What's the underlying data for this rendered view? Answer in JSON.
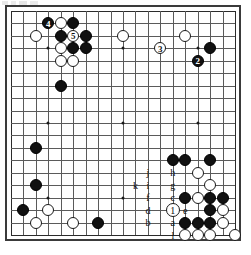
{
  "diagram": {
    "kind": "go-board-diagram",
    "board_size": 19,
    "caption": "",
    "colors": {
      "black_stone": "#111111",
      "white_stone": "#ffffff",
      "grid_line": "#5a5a5a",
      "board_border": "#3a3a3a",
      "background": "#ffffff"
    },
    "star_points": [
      {
        "col": 3,
        "row": 3
      },
      {
        "col": 9,
        "row": 3
      },
      {
        "col": 15,
        "row": 3
      },
      {
        "col": 3,
        "row": 9
      },
      {
        "col": 9,
        "row": 9
      },
      {
        "col": 15,
        "row": 9
      },
      {
        "col": 3,
        "row": 15
      },
      {
        "col": 9,
        "row": 15
      },
      {
        "col": 15,
        "row": 15
      }
    ],
    "stones": [
      {
        "col": 5,
        "row": 1,
        "color": "black"
      },
      {
        "col": 4,
        "row": 1,
        "color": "white"
      },
      {
        "col": 3,
        "row": 1,
        "color": "black",
        "label": "4",
        "label_kind": "move-number"
      },
      {
        "col": 2,
        "row": 2,
        "color": "white"
      },
      {
        "col": 4,
        "row": 2,
        "color": "black"
      },
      {
        "col": 5,
        "row": 2,
        "color": "white",
        "label": "5",
        "label_kind": "move-number"
      },
      {
        "col": 6,
        "row": 2,
        "color": "black"
      },
      {
        "col": 4,
        "row": 3,
        "color": "white"
      },
      {
        "col": 5,
        "row": 3,
        "color": "black"
      },
      {
        "col": 6,
        "row": 3,
        "color": "black"
      },
      {
        "col": 4,
        "row": 4,
        "color": "white"
      },
      {
        "col": 5,
        "row": 4,
        "color": "white"
      },
      {
        "col": 4,
        "row": 6,
        "color": "black"
      },
      {
        "col": 9,
        "row": 2,
        "color": "white"
      },
      {
        "col": 14,
        "row": 2,
        "color": "white"
      },
      {
        "col": 12,
        "row": 3,
        "color": "white",
        "label": "3",
        "label_kind": "move-number"
      },
      {
        "col": 16,
        "row": 3,
        "color": "black"
      },
      {
        "col": 15,
        "row": 4,
        "color": "black",
        "label": "2",
        "label_kind": "move-number"
      },
      {
        "col": 2,
        "row": 11,
        "color": "black"
      },
      {
        "col": 2,
        "row": 14,
        "color": "black"
      },
      {
        "col": 1,
        "row": 16,
        "color": "black"
      },
      {
        "col": 3,
        "row": 16,
        "color": "white"
      },
      {
        "col": 2,
        "row": 17,
        "color": "white"
      },
      {
        "col": 5,
        "row": 17,
        "color": "white"
      },
      {
        "col": 7,
        "row": 17,
        "color": "black"
      },
      {
        "col": 13,
        "row": 12,
        "color": "black"
      },
      {
        "col": 14,
        "row": 12,
        "color": "black"
      },
      {
        "col": 16,
        "row": 12,
        "color": "black"
      },
      {
        "col": 15,
        "row": 13,
        "color": "white"
      },
      {
        "col": 16,
        "row": 14,
        "color": "white"
      },
      {
        "col": 14,
        "row": 15,
        "color": "black"
      },
      {
        "col": 15,
        "row": 15,
        "color": "white"
      },
      {
        "col": 16,
        "row": 15,
        "color": "black"
      },
      {
        "col": 17,
        "row": 15,
        "color": "black"
      },
      {
        "col": 16,
        "row": 16,
        "color": "black"
      },
      {
        "col": 17,
        "row": 16,
        "color": "white"
      },
      {
        "col": 14,
        "row": 17,
        "color": "black"
      },
      {
        "col": 15,
        "row": 17,
        "color": "black"
      },
      {
        "col": 16,
        "row": 17,
        "color": "black"
      },
      {
        "col": 17,
        "row": 17,
        "color": "white"
      },
      {
        "col": 14,
        "row": 18,
        "color": "white"
      },
      {
        "col": 15,
        "row": 18,
        "color": "white"
      },
      {
        "col": 16,
        "row": 18,
        "color": "white"
      },
      {
        "col": 18,
        "row": 18,
        "color": "white"
      }
    ],
    "move_markers": [
      {
        "label": "2",
        "on": "black",
        "col": 15,
        "row": 4
      },
      {
        "label": "3",
        "on": "white",
        "col": 12,
        "row": 3
      },
      {
        "label": "4",
        "on": "black",
        "col": 3,
        "row": 1
      },
      {
        "label": "5",
        "on": "white",
        "col": 5,
        "row": 2
      }
    ],
    "letter_markers": [
      {
        "label": "j",
        "col": 11,
        "row": 13,
        "on": "empty"
      },
      {
        "label": "h",
        "col": 13,
        "row": 13,
        "on": "empty"
      },
      {
        "label": "k",
        "col": 10,
        "row": 14,
        "on": "empty"
      },
      {
        "label": "i",
        "col": 11,
        "row": 14,
        "on": "empty"
      },
      {
        "label": "g",
        "col": 13,
        "row": 14,
        "on": "empty"
      },
      {
        "label": "f",
        "col": 11,
        "row": 15,
        "on": "empty"
      },
      {
        "label": "c",
        "col": 13,
        "row": 15,
        "on": "empty"
      },
      {
        "label": "d",
        "col": 11,
        "row": 16,
        "on": "empty"
      },
      {
        "label": "1",
        "col": 13,
        "row": 16,
        "on": "white-circle"
      },
      {
        "label": "e",
        "col": 14,
        "row": 16,
        "on": "empty"
      },
      {
        "label": "b",
        "col": 11,
        "row": 17,
        "on": "empty"
      },
      {
        "label": "a",
        "col": 13,
        "row": 17,
        "on": "empty"
      },
      {
        "label": "l",
        "col": 13,
        "row": 18,
        "on": "empty"
      }
    ]
  }
}
